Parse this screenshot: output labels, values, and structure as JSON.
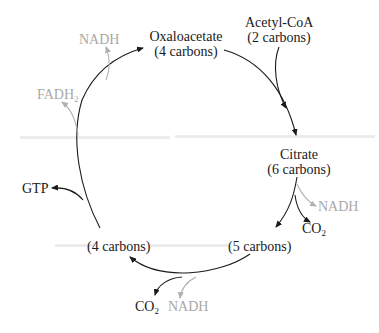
{
  "diagram": {
    "type": "cycle",
    "nodes": {
      "oxaloacetate": {
        "name": "Oxaloacetate",
        "carbons": "(4 carbons)"
      },
      "acetyl_coa": {
        "name": "Acetyl-CoA",
        "carbons": "(2 carbons)"
      },
      "citrate": {
        "name": "Citrate",
        "carbons": "(6 carbons)"
      },
      "five_carbon": {
        "carbons": "(5 carbons)"
      },
      "four_carbon": {
        "carbons": "(4 carbons)"
      }
    },
    "byproducts": {
      "nadh_top": "NADH",
      "fadh2": {
        "base": "FADH",
        "subscript": "2"
      },
      "gtp": "GTP",
      "nadh_right": "NADH",
      "co2_right": {
        "base": "CO",
        "subscript": "2"
      },
      "co2_bottom": {
        "base": "CO",
        "subscript": "2"
      },
      "nadh_bottom": "NADH"
    },
    "colors": {
      "main": "#1a1a1a",
      "faded": "#a8a8a8"
    },
    "edges": [
      {
        "from": "Oxaloacetate",
        "to": "Citrate",
        "input": "Acetyl-CoA"
      },
      {
        "from": "Citrate",
        "to": "(5 carbons)",
        "outputs": [
          "NADH",
          "CO2"
        ]
      },
      {
        "from": "(5 carbons)",
        "to": "(4 carbons)",
        "outputs": [
          "CO2",
          "NADH"
        ]
      },
      {
        "from": "(4 carbons)",
        "to": "Oxaloacetate",
        "outputs": [
          "GTP",
          "FADH2",
          "NADH"
        ]
      }
    ]
  }
}
